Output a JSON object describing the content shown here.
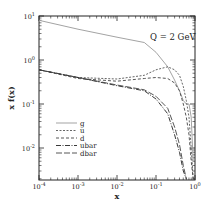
{
  "chart_data": {
    "type": "line",
    "title": "",
    "annotation": "Q = 2 GeV",
    "xlabel": "x",
    "ylabel": "x f(x)",
    "xscale": "log",
    "yscale": "log",
    "xlim": [
      0.0001,
      1
    ],
    "ylim": [
      0.002,
      10
    ],
    "x_ticks": [
      "10^-4",
      "10^-3",
      "10^-2",
      "10^-1",
      "10^0"
    ],
    "y_ticks": [
      "10^1",
      "10^0",
      "10^-1",
      "10^-2"
    ],
    "grid": false,
    "legend_position": "lower-left",
    "x": [
      0.0001,
      0.001,
      0.01,
      0.05,
      0.1,
      0.2,
      0.3,
      0.4,
      0.5,
      0.6,
      0.7,
      0.8,
      0.9
    ],
    "series": [
      {
        "name": "g",
        "style": "solid-gray",
        "values": [
          8,
          5,
          3.3,
          2.5,
          1.5,
          0.7,
          0.35,
          0.2,
          0.12,
          0.1,
          0.1,
          0.05,
          0.005
        ]
      },
      {
        "name": "u",
        "style": "dotted",
        "values": [
          0.6,
          0.4,
          0.37,
          0.45,
          0.6,
          0.7,
          0.6,
          0.45,
          0.25,
          0.12,
          0.05,
          0.01,
          0.002
        ]
      },
      {
        "name": "d",
        "style": "dashed",
        "values": [
          0.6,
          0.38,
          0.33,
          0.38,
          0.4,
          0.38,
          0.3,
          0.2,
          0.1,
          0.05,
          0.02,
          0.005,
          0.002
        ]
      },
      {
        "name": "ubar",
        "style": "dash-dot",
        "values": [
          0.6,
          0.4,
          0.26,
          0.2,
          0.13,
          0.06,
          0.02,
          0.008,
          0.003,
          0.002,
          null,
          null,
          null
        ]
      },
      {
        "name": "dbar",
        "style": "long-dash",
        "values": [
          0.6,
          0.4,
          0.27,
          0.21,
          0.15,
          0.08,
          0.03,
          0.012,
          0.004,
          0.002,
          null,
          null,
          null
        ]
      }
    ]
  },
  "legend": {
    "items": [
      {
        "label": "g"
      },
      {
        "label": "u"
      },
      {
        "label": "d"
      },
      {
        "label": "ubar"
      },
      {
        "label": "dbar"
      }
    ]
  },
  "axes": {
    "xlabel": "x",
    "ylabel": "x f(x)",
    "annotation": "Q = 2 GeV"
  }
}
